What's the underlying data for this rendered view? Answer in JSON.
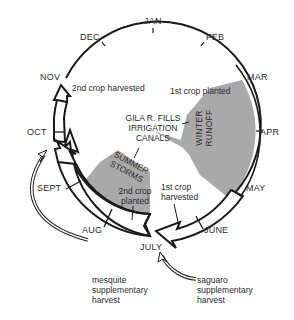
{
  "diagram": {
    "type": "seasonal-cycle",
    "months": [
      "JAN",
      "FEB",
      "MAR",
      "APR",
      "MAY",
      "JUNE",
      "JULY",
      "AUG",
      "SEPT",
      "OCT",
      "NOV",
      "DEC"
    ],
    "center_label": [
      "GILA R. FILLS",
      "IRRIGATION",
      "CANALS"
    ],
    "seasons": {
      "winter": [
        "WINTER",
        "RUNOFF"
      ],
      "summer": [
        "SUMMER",
        "STORMS"
      ]
    },
    "events": {
      "first_planted": "1st crop planted",
      "first_harvested": [
        "1st crop",
        "harvested"
      ],
      "second_planted": [
        "2nd crop",
        "planted"
      ],
      "second_harvested": "2nd crop harvested"
    },
    "supplementary": {
      "mesquite": [
        "mesquite",
        "supplementary",
        "harvest"
      ],
      "saguaro": [
        "saguaro",
        "supplementary",
        "harvest"
      ]
    },
    "colors": {
      "line": "#1a1a1a",
      "shade": "#a9a9a9",
      "text": "#2a2a2a"
    }
  }
}
